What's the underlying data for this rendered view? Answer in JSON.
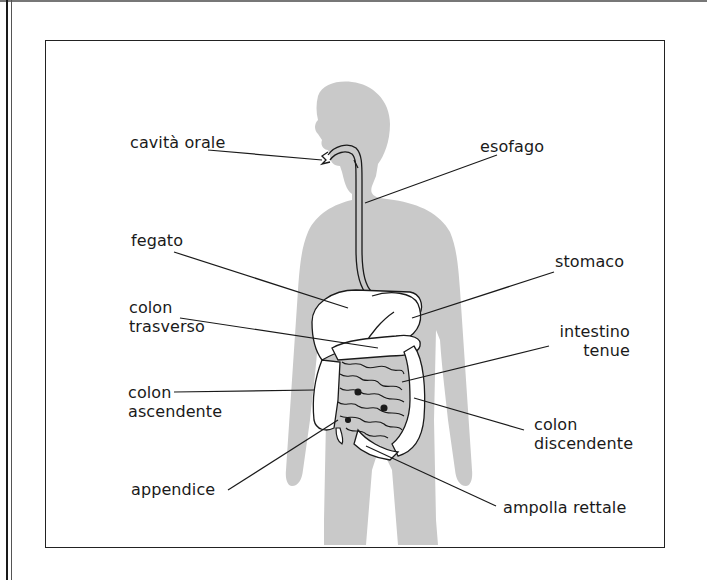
{
  "diagram": {
    "title": "",
    "colors": {
      "silhouette": "#c9c9c9",
      "organ_fill": "#ffffff",
      "line": "#1a1a1a",
      "frame": "#222222"
    },
    "labels": {
      "cavita_orale": "cavità orale",
      "esofago": "esofago",
      "fegato": "fegato",
      "stomaco": "stomaco",
      "colon_trasverso_1": "colon",
      "colon_trasverso_2": "trasverso",
      "intestino_tenue_1": "intestino",
      "intestino_tenue_2": "tenue",
      "colon_ascendente_1": "colon",
      "colon_ascendente_2": "ascendente",
      "colon_discendente_1": "colon",
      "colon_discendente_2": "discendente",
      "appendice": "appendice",
      "ampolla_rettale": "ampolla rettale"
    }
  }
}
